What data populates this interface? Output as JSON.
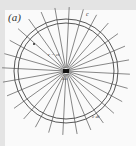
{
  "figure": {
    "panel_label": "(a)",
    "labels": {
      "velocity": "c",
      "radius": "r = ct",
      "center": "dω",
      "shell_thickness": "c dt"
    },
    "radial_line_count": 28,
    "colors": {
      "frame": "#e4e4e4",
      "background": "#fafafa",
      "ink": "#333333"
    }
  }
}
